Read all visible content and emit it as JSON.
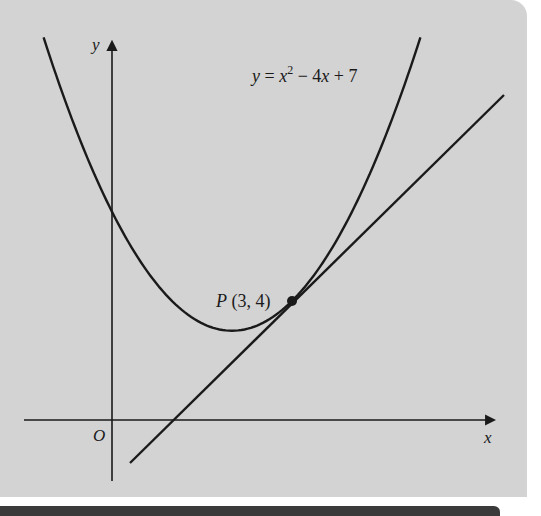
{
  "chart_data": {
    "type": "line",
    "title": "",
    "xlabel": "x",
    "ylabel": "y",
    "origin_label": "O",
    "grid": false,
    "xlim": [
      -1.87,
      6.43
    ],
    "ylim": [
      -2.07,
      12.77
    ],
    "series": [
      {
        "name": "y = x^2 - 4x + 7",
        "kind": "curve",
        "equation": "y = x^2 - 4x + 7",
        "x_range": [
          -1.14,
          5.14
        ],
        "points": [
          [
            -1.14,
            16.86
          ],
          [
            -1,
            12
          ],
          [
            0,
            7
          ],
          [
            1,
            4
          ],
          [
            2,
            3
          ],
          [
            3,
            4
          ],
          [
            4,
            7
          ],
          [
            5,
            12
          ],
          [
            5.14,
            12.86
          ]
        ],
        "y_intercept": 7,
        "vertex": [
          2,
          3
        ]
      },
      {
        "name": "tangent at P",
        "kind": "line",
        "equation": "y = 2x - 2",
        "x_range": [
          0.3,
          6.55
        ],
        "x_intercept": 1
      }
    ],
    "annotations": [
      {
        "type": "point",
        "label": "P (3, 4)",
        "x": 3,
        "y": 4
      },
      {
        "type": "label",
        "text": "y = x² − 4x + 7",
        "near": "upper-right of curve"
      }
    ]
  },
  "labels": {
    "y_axis": "y",
    "x_axis": "x",
    "origin": "O",
    "curve_eq_y": "y",
    "curve_eq_eq": " = ",
    "curve_eq_x": "x",
    "curve_eq_exp": "2",
    "curve_eq_rest1": " − 4",
    "curve_eq_x2": "x",
    "curve_eq_rest2": " + 7",
    "point_name": "P",
    "point_coords": " (3, 4)"
  },
  "colors": {
    "panel_bg": "#d3d3d3",
    "ink": "#1a1a1a",
    "bottom_bar": "#3a3a3a"
  }
}
